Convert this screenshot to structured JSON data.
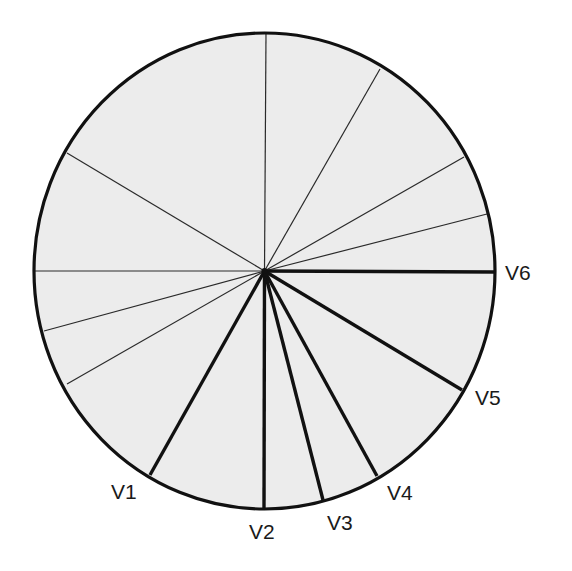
{
  "diagram": {
    "type": "radial-pie-division",
    "center": [
      264.5,
      271
    ],
    "radius_x": 230.5,
    "radius_y": 238,
    "fill_color": "#ececec",
    "stroke_color": "#111111",
    "background": "#ffffff",
    "thin_lines": [
      {
        "end": [
          266,
          33
        ]
      },
      {
        "end": [
          380,
          69
        ]
      },
      {
        "end": [
          464,
          157
        ]
      },
      {
        "end": [
          487,
          214
        ]
      },
      {
        "end": [
          67,
          153
        ]
      },
      {
        "end": [
          34,
          271
        ]
      },
      {
        "end": [
          44,
          331
        ]
      },
      {
        "end": [
          67,
          384
        ]
      }
    ],
    "labeled_lines": [
      {
        "label": "V1",
        "end": [
          150,
          475
        ],
        "label_pos": [
          111,
          481
        ]
      },
      {
        "label": "V2",
        "end": [
          264,
          509
        ],
        "label_pos": [
          249,
          521
        ]
      },
      {
        "label": "V3",
        "end": [
          323,
          500
        ],
        "label_pos": [
          327,
          512
        ]
      },
      {
        "label": "V4",
        "end": [
          377,
          476
        ],
        "label_pos": [
          387,
          482
        ]
      },
      {
        "label": "V5",
        "end": [
          462,
          390
        ],
        "label_pos": [
          475,
          387
        ]
      },
      {
        "label": "V6",
        "end": [
          495,
          272
        ],
        "label_pos": [
          505,
          262
        ]
      }
    ]
  },
  "labels": {
    "v1": "V1",
    "v2": "V2",
    "v3": "V3",
    "v4": "V4",
    "v5": "V5",
    "v6": "V6"
  }
}
